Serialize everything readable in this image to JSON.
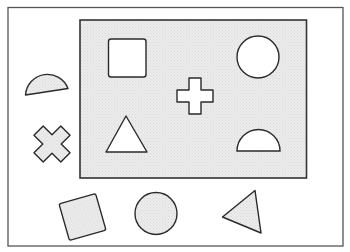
{
  "figure": {
    "colors": {
      "background": "#ffffff",
      "frame_stroke": "#4a4a4a",
      "board_fill": "#e8e8e8",
      "slot_fill": "#ffffff",
      "loose_fill": "#ececec",
      "shape_stroke": "#2a2a2a"
    },
    "board": {
      "slots": [
        {
          "shape": "square",
          "label": "square-slot"
        },
        {
          "shape": "circle",
          "label": "circle-slot"
        },
        {
          "shape": "cross",
          "label": "cross-slot"
        },
        {
          "shape": "triangle",
          "label": "triangle-slot"
        },
        {
          "shape": "semicircle",
          "label": "semicircle-slot"
        }
      ]
    },
    "loose_pieces": [
      {
        "shape": "semicircle",
        "orientation": "tilted"
      },
      {
        "shape": "cross",
        "orientation": "rotated 45°"
      },
      {
        "shape": "square",
        "orientation": "rotated"
      },
      {
        "shape": "circle",
        "orientation": "upright"
      },
      {
        "shape": "triangle",
        "orientation": "rotated"
      }
    ]
  }
}
